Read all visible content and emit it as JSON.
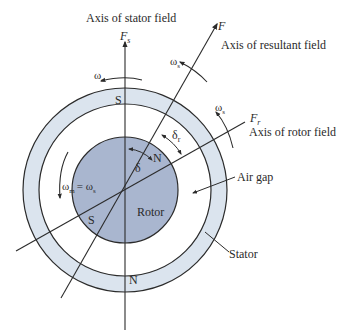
{
  "diagram": {
    "title_labels": {
      "stator_axis": "Axis of stator field",
      "resultant_axis": "Axis of resultant field",
      "rotor_axis": "Axis of rotor field"
    },
    "vectors": {
      "stator_field": {
        "symbol": "F",
        "subscript": "s"
      },
      "resultant_field": {
        "symbol": "F",
        "subscript": ""
      },
      "rotor_field": {
        "symbol": "F",
        "subscript": "r"
      }
    },
    "speeds": {
      "stator": {
        "symbol": "ω",
        "subscript": "s"
      },
      "resultant": {
        "symbol": "ω",
        "subscript": "s"
      },
      "rotor_axis": {
        "symbol": "ω",
        "subscript": "s"
      },
      "rotor_mech": {
        "symbol": "ω",
        "subscript": "m",
        "equals": "= ω",
        "equals_subscript": "s"
      }
    },
    "angles": {
      "delta": "δ",
      "delta_r": {
        "symbol": "δ",
        "subscript": "r"
      }
    },
    "poles": {
      "stator_top": "S",
      "stator_bottom": "N",
      "rotor_north": "N",
      "rotor_south": "S"
    },
    "parts": {
      "rotor": "Rotor",
      "air_gap": "Air gap",
      "stator": "Stator"
    },
    "colors": {
      "stator_fill": "#dbe4ee",
      "rotor_fill": "#a9b6cf",
      "line": "#2b2b2b",
      "background": "#ffffff"
    }
  }
}
